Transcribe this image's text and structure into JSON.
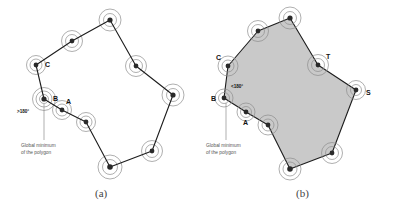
{
  "figure": {
    "background": "#ffffff",
    "stroke_color": "#1c1c1c",
    "arc_color": "#8d8d8d",
    "fill_color": "#c9c9c9",
    "vertex_dot_color": "#2a2a2a",
    "panels": [
      {
        "id": "a",
        "caption": "(a)",
        "filled": false,
        "angle_note": ">180°",
        "callout_line1": "Global minimum",
        "callout_line2": "of the polygon",
        "vertex_labels": [
          {
            "name": "A",
            "text": "A"
          },
          {
            "name": "B",
            "text": "B"
          },
          {
            "name": "C",
            "text": "C"
          }
        ],
        "polygon_points": "44,99 36,65 72,41 110,20 136,66 173,95 152,151 110,167 86,122 62,110",
        "vertices": [
          {
            "x": 44,
            "y": 99,
            "r": 9.5,
            "label": "B",
            "lx": 53,
            "ly": 101
          },
          {
            "x": 36,
            "y": 65,
            "r": 8.5,
            "label": "C",
            "lx": 45,
            "ly": 67
          },
          {
            "x": 72,
            "y": 41,
            "r": 9.0,
            "label": "",
            "lx": 0,
            "ly": 0
          },
          {
            "x": 110,
            "y": 20,
            "r": 9.5,
            "label": "",
            "lx": 0,
            "ly": 0
          },
          {
            "x": 136,
            "y": 66,
            "r": 9.0,
            "label": "",
            "lx": 0,
            "ly": 0
          },
          {
            "x": 173,
            "y": 95,
            "r": 9.5,
            "label": "",
            "lx": 0,
            "ly": 0
          },
          {
            "x": 152,
            "y": 151,
            "r": 9.0,
            "label": "",
            "lx": 0,
            "ly": 0
          },
          {
            "x": 110,
            "y": 167,
            "r": 10.0,
            "label": "",
            "lx": 0,
            "ly": 0
          },
          {
            "x": 86,
            "y": 122,
            "r": 8.5,
            "label": "",
            "lx": 0,
            "ly": 0
          },
          {
            "x": 62,
            "y": 110,
            "r": 8.5,
            "label": "A",
            "lx": 66,
            "ly": 104
          }
        ]
      },
      {
        "id": "b",
        "caption": "(b)",
        "filled": true,
        "angle_note": "<180°",
        "callout_line1": "Global minimum",
        "callout_line2": "of the polygon",
        "vertex_labels": [
          {
            "name": "A",
            "text": "A"
          },
          {
            "name": "B",
            "text": "B"
          },
          {
            "name": "C",
            "text": "C"
          },
          {
            "name": "S",
            "text": "S"
          },
          {
            "name": "T",
            "text": "T"
          }
        ],
        "polygon_points": "224,98 228,66 258,31 290,18 318,65 356,90 332,153 290,169 268,125 246,112",
        "vertices": [
          {
            "x": 224,
            "y": 98,
            "r": 8.0,
            "label": "B",
            "lx": 212,
            "ly": 101
          },
          {
            "x": 228,
            "y": 66,
            "r": 8.5,
            "label": "C",
            "lx": 218,
            "ly": 59
          },
          {
            "x": 258,
            "y": 31,
            "r": 9.0,
            "label": "",
            "lx": 0,
            "ly": 0
          },
          {
            "x": 290,
            "y": 18,
            "r": 9.5,
            "label": "",
            "lx": 0,
            "ly": 0
          },
          {
            "x": 318,
            "y": 65,
            "r": 9.0,
            "label": "T",
            "lx": 327,
            "ly": 59
          },
          {
            "x": 356,
            "y": 90,
            "r": 8.0,
            "label": "S",
            "lx": 366,
            "ly": 95
          },
          {
            "x": 332,
            "y": 153,
            "r": 9.0,
            "label": "",
            "lx": 0,
            "ly": 0
          },
          {
            "x": 290,
            "y": 169,
            "r": 9.5,
            "label": "",
            "lx": 0,
            "ly": 0
          },
          {
            "x": 268,
            "y": 125,
            "r": 8.5,
            "label": "",
            "lx": 0,
            "ly": 0
          },
          {
            "x": 246,
            "y": 112,
            "r": 8.0,
            "label": "A",
            "lx": 248,
            "ly": 124
          }
        ]
      }
    ]
  }
}
